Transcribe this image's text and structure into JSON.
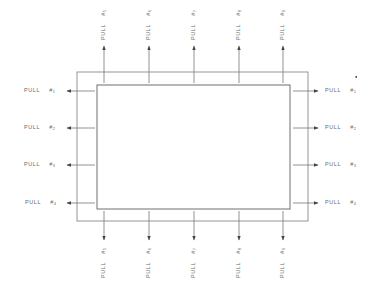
{
  "diagram": {
    "word": "PULL",
    "hash": "#",
    "colors": {
      "line": "#8a8a8a",
      "arrow": "#555555",
      "text": "#6a6a6a"
    },
    "outer_rect": {
      "x": 77,
      "y": 72,
      "w": 231,
      "h": 149
    },
    "inner_rect": {
      "x": 97,
      "y": 85,
      "w": 193,
      "h": 124
    },
    "left_pulls": [
      {
        "label": "PULL",
        "number": "1",
        "y": 91
      },
      {
        "label": "PULL",
        "number": "2",
        "y": 128
      },
      {
        "label": "PULL",
        "number": "3",
        "y": 165
      },
      {
        "label": "PULL",
        "number": "4",
        "y": 203
      }
    ],
    "right_pulls": [
      {
        "label": "PULL",
        "number": "1",
        "y": 91
      },
      {
        "label": "PULL",
        "number": "2",
        "y": 128
      },
      {
        "label": "PULL",
        "number": "3",
        "y": 165
      },
      {
        "label": "PULL",
        "number": "4",
        "y": 203
      }
    ],
    "top_pulls": [
      {
        "label": "PULL",
        "number": "5",
        "x": 104
      },
      {
        "label": "PULL",
        "number": "6",
        "x": 149
      },
      {
        "label": "PULL",
        "number": "7",
        "x": 194
      },
      {
        "label": "PULL",
        "number": "8",
        "x": 239
      },
      {
        "label": "PULL",
        "number": "9",
        "x": 283
      }
    ],
    "bottom_pulls": [
      {
        "label": "PULL",
        "number": "5",
        "x": 104
      },
      {
        "label": "PULL",
        "number": "6",
        "x": 149
      },
      {
        "label": "PULL",
        "number": "7",
        "x": 194
      },
      {
        "label": "PULL",
        "number": "8",
        "x": 239
      },
      {
        "label": "PULL",
        "number": "9",
        "x": 283
      }
    ]
  }
}
